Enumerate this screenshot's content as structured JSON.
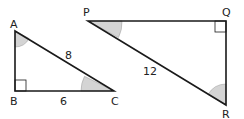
{
  "triangle_abc": {
    "vertices": {
      "A": "A",
      "B": "B",
      "C": "C"
    },
    "side_ac": "8",
    "side_bc": "6",
    "right_angle_at": "B",
    "marked_angles": [
      "A",
      "C"
    ]
  },
  "triangle_pqr": {
    "vertices": {
      "P": "P",
      "Q": "Q",
      "R": "R"
    },
    "side_pr": "12",
    "right_angle_at": "Q",
    "marked_angles": [
      "P",
      "R"
    ]
  },
  "colors": {
    "line": "#1a1a1a",
    "angle_fill": "#d4d4d4"
  }
}
